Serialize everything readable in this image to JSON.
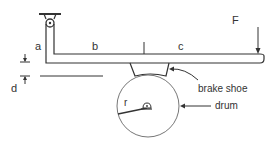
{
  "diagram": {
    "colors": {
      "line": "#333333",
      "thin_line": "#777777",
      "background": "#ffffff"
    },
    "labels": {
      "a": "a",
      "b": "b",
      "c": "c",
      "d": "d",
      "F": "F",
      "r": "r",
      "brake_shoe": "brake shoe",
      "drum": "drum"
    },
    "components": [
      {
        "id": "pivot",
        "kind": "fixed-pin-support"
      },
      {
        "id": "lever",
        "kind": "L-shaped lever",
        "segments": [
          "a",
          "b",
          "c"
        ]
      },
      {
        "id": "brake_shoe",
        "kind": "trapezoidal block under lever"
      },
      {
        "id": "drum",
        "kind": "circle with center pin",
        "radius_label": "r"
      },
      {
        "id": "force",
        "kind": "downward arrow at lever tip",
        "label": "F"
      },
      {
        "id": "gap",
        "kind": "dimension arrows",
        "label": "d"
      }
    ]
  }
}
